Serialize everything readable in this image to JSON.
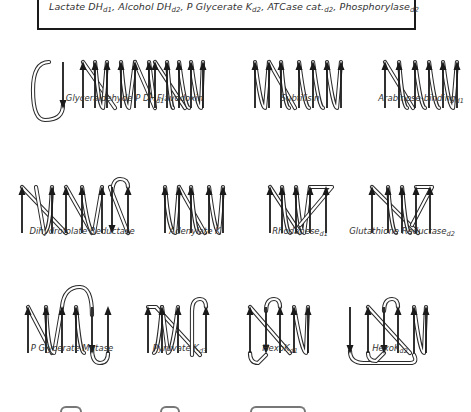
{
  "header": {
    "entries": [
      {
        "name": "Lactate DH",
        "sub": "d1"
      },
      {
        "name": "Alcohol DH",
        "sub": "d2"
      },
      {
        "name": "P Glycerate K",
        "sub": "d2"
      },
      {
        "name": "ATCase cat.",
        "sub": "d2"
      },
      {
        "name": "Phosphorylase",
        "sub": "d2"
      }
    ],
    "separator": ", "
  },
  "panels": [
    {
      "name": "Glyceraldehyde P DH",
      "sub": "d1",
      "x": 55,
      "y": 60,
      "strands": [
        {
          "x": 8,
          "dir": "down"
        },
        {
          "x": 28,
          "dir": "up"
        },
        {
          "x": 40,
          "dir": "up"
        },
        {
          "x": 52,
          "dir": "up"
        },
        {
          "x": 66,
          "dir": "up"
        },
        {
          "x": 80,
          "dir": "up"
        },
        {
          "x": 94,
          "dir": "up"
        }
      ],
      "loops": [
        "M8 45 Q8 60 -10 60 Q-22 60 -22 30 Q-22 2 -6 2",
        "M28 2 L60 48",
        "M40 2 Q44 48 48 48 L52 2",
        "M66 2 Q70 48 74 48 L80 2",
        "M80 2 L100 48 L94 2"
      ],
      "caption_x": 60,
      "caption_y": 105
    },
    {
      "name": "Flavodoxin",
      "sub": "",
      "x": 155,
      "y": 60,
      "strands": [
        {
          "x": 0,
          "dir": "up"
        },
        {
          "x": 12,
          "dir": "up"
        },
        {
          "x": 24,
          "dir": "up"
        },
        {
          "x": 36,
          "dir": "up"
        },
        {
          "x": 48,
          "dir": "up"
        }
      ],
      "loops": [
        "M0 2 L30 48",
        "M12 2 Q16 48 18 48",
        "M24 2 Q30 48 34 48",
        "M36 2 Q42 48 46 48 L48 2"
      ],
      "caption_x": 25,
      "caption_y": 105
    },
    {
      "name": "Subtilisin",
      "sub": "",
      "x": 255,
      "y": 60,
      "strands": [
        {
          "x": 0,
          "dir": "up"
        },
        {
          "x": 14,
          "dir": "up"
        },
        {
          "x": 26,
          "dir": "up"
        },
        {
          "x": 44,
          "dir": "up"
        },
        {
          "x": 58,
          "dir": "up"
        },
        {
          "x": 72,
          "dir": "up"
        },
        {
          "x": 86,
          "dir": "up"
        }
      ],
      "loops": [
        "M0 2 Q6 48 10 48 L14 2",
        "M14 2 L40 48",
        "M26 2 Q30 48 34 48",
        "M44 2 Q50 48 54 48",
        "M58 2 Q64 48 68 48",
        "M72 2 Q78 48 82 48 L86 2"
      ],
      "caption_x": 45,
      "caption_y": 105
    },
    {
      "name": "Arabinose-binding",
      "sub": "d1",
      "x": 385,
      "y": 60,
      "strands": [
        {
          "x": 0,
          "dir": "up"
        },
        {
          "x": 14,
          "dir": "up"
        },
        {
          "x": 30,
          "dir": "up"
        },
        {
          "x": 44,
          "dir": "up"
        },
        {
          "x": 58,
          "dir": "up"
        },
        {
          "x": 72,
          "dir": "up"
        }
      ],
      "loops": [
        "M0 2 L28 48",
        "M14 2 Q18 48 22 48",
        "M30 2 Q36 48 40 48",
        "M44 2 Q50 48 54 48",
        "M58 2 Q64 48 68 48 L72 2"
      ],
      "caption_x": 36,
      "caption_y": 105
    },
    {
      "name": "Dihydrofolate Reductase",
      "sub": "",
      "x": 22,
      "y": 185,
      "strands": [
        {
          "x": 0,
          "dir": "up"
        },
        {
          "x": 30,
          "dir": "up"
        },
        {
          "x": 44,
          "dir": "up"
        },
        {
          "x": 60,
          "dir": "up"
        },
        {
          "x": 80,
          "dir": "up"
        },
        {
          "x": 90,
          "dir": "down"
        },
        {
          "x": 106,
          "dir": "up"
        }
      ],
      "loops": [
        "M0 2 L44 48",
        "M30 2 Q28 48 22 48 L14 2",
        "M44 2 L70 48",
        "M60 2 Q66 48 72 48 L80 2",
        "M90 10 Q90 -6 98 -6 Q106 -6 106 2",
        "M106 48 L88 2"
      ],
      "caption_x": 60,
      "caption_y": 238
    },
    {
      "name": "Adenylate K",
      "sub": "",
      "x": 165,
      "y": 185,
      "strands": [
        {
          "x": 0,
          "dir": "up"
        },
        {
          "x": 14,
          "dir": "up"
        },
        {
          "x": 26,
          "dir": "up"
        },
        {
          "x": 44,
          "dir": "up"
        },
        {
          "x": 58,
          "dir": "up"
        }
      ],
      "loops": [
        "M0 2 Q4 48 10 48 L14 2",
        "M14 2 L40 48",
        "M26 2 Q30 48 34 48",
        "M44 2 Q50 48 54 48 L58 2"
      ],
      "caption_x": 30,
      "caption_y": 238
    },
    {
      "name": "Rhodanese",
      "sub": "d1",
      "x": 270,
      "y": 185,
      "strands": [
        {
          "x": 0,
          "dir": "up"
        },
        {
          "x": 12,
          "dir": "up"
        },
        {
          "x": 26,
          "dir": "up"
        },
        {
          "x": 40,
          "dir": "up"
        },
        {
          "x": 56,
          "dir": "up"
        }
      ],
      "loops": [
        "M0 2 L30 48",
        "M12 2 Q16 48 20 48",
        "M26 2 Q30 48 34 48 L40 2",
        "M40 2 L62 2 L30 40"
      ],
      "caption_x": 30,
      "caption_y": 238
    },
    {
      "name": "Glutathione Reductase",
      "sub": "d2",
      "x": 372,
      "y": 185,
      "strands": [
        {
          "x": 0,
          "dir": "up"
        },
        {
          "x": 16,
          "dir": "up"
        },
        {
          "x": 30,
          "dir": "up"
        },
        {
          "x": 44,
          "dir": "up"
        },
        {
          "x": 58,
          "dir": "up"
        }
      ],
      "loops": [
        "M0 2 L46 48",
        "M16 2 Q20 48 24 48",
        "M30 2 Q34 48 38 48",
        "M44 2 L60 2 L40 40"
      ],
      "caption_x": 30,
      "caption_y": 238
    },
    {
      "name": "P Glycerate Mutase",
      "sub": "",
      "x": 28,
      "y": 305,
      "strands": [
        {
          "x": 0,
          "dir": "up"
        },
        {
          "x": 18,
          "dir": "up"
        },
        {
          "x": 34,
          "dir": "up"
        },
        {
          "x": 48,
          "dir": "up"
        },
        {
          "x": 64,
          "dir": "down"
        },
        {
          "x": 80,
          "dir": "up"
        }
      ],
      "loops": [
        "M0 2 L24 48",
        "M18 2 Q20 48 26 48 L34 2",
        "M34 2 Q36 -18 52 -18 Q64 -18 64 10",
        "M48 2 Q52 48 56 48",
        "M64 44 Q64 58 72 58 Q80 58 80 48"
      ],
      "caption_x": 44,
      "caption_y": 355
    },
    {
      "name": "Pyruvate K",
      "sub": "d3",
      "x": 148,
      "y": 305,
      "strands": [
        {
          "x": 0,
          "dir": "up"
        },
        {
          "x": 14,
          "dir": "up"
        },
        {
          "x": 30,
          "dir": "up"
        },
        {
          "x": 58,
          "dir": "up"
        }
      ],
      "loops": [
        "M0 2 L8 2 L52 50",
        "M14 2 Q10 48 6 48",
        "M30 2 Q24 48 20 48 L14 2",
        "M44 50 L44 6 Q44 -6 52 -6 Q58 -6 58 2"
      ],
      "caption_x": 32,
      "caption_y": 355
    },
    {
      "name": "HexoK",
      "sub": "d1",
      "x": 250,
      "y": 305,
      "strands": [
        {
          "x": 0,
          "dir": "up"
        },
        {
          "x": 16,
          "dir": "down"
        },
        {
          "x": 30,
          "dir": "up"
        },
        {
          "x": 44,
          "dir": "up"
        },
        {
          "x": 58,
          "dir": "up"
        }
      ],
      "loops": [
        "M0 2 L40 48",
        "M0 48 Q0 58 8 58 L16 50",
        "M16 6 Q16 -6 24 -6 Q30 -6 30 2",
        "M44 2 Q52 48 56 48 L58 2"
      ],
      "caption_x": 30,
      "caption_y": 355
    },
    {
      "name": "HexoK",
      "sub": "d2",
      "x": 350,
      "y": 305,
      "strands": [
        {
          "x": 0,
          "dir": "down"
        },
        {
          "x": 18,
          "dir": "up"
        },
        {
          "x": 34,
          "dir": "down"
        },
        {
          "x": 48,
          "dir": "up"
        },
        {
          "x": 64,
          "dir": "up"
        },
        {
          "x": 76,
          "dir": "up"
        }
      ],
      "loops": [
        "M0 46 Q0 58 14 58 L60 58 Q68 58 64 50",
        "M18 2 L60 48",
        "M18 48 Q18 56 26 56 L34 48",
        "M34 6 Q34 -6 42 -6 Q48 -6 48 2",
        "M64 2 Q70 48 74 48 L76 2"
      ],
      "caption_x": 40,
      "caption_y": 355
    }
  ],
  "bottom_partial": {
    "fragments": [
      {
        "x": 60,
        "w": 22
      },
      {
        "x": 160,
        "w": 20
      },
      {
        "x": 250,
        "w": 56
      }
    ]
  }
}
